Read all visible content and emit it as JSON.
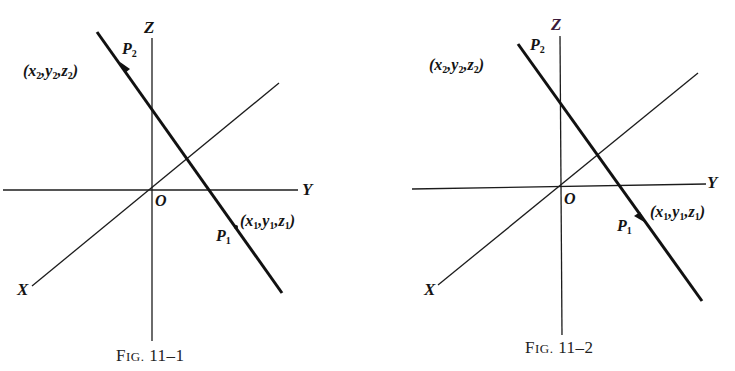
{
  "figures": [
    {
      "caption_prefix": "F",
      "caption_small": "ig.",
      "caption_number": "11–1",
      "caption": "Fig. 11–1",
      "axes": {
        "x": "X",
        "y": "Y",
        "z": "Z",
        "origin": "O"
      },
      "points": {
        "p1": {
          "name": "P",
          "sub": "1",
          "coords_text": "(x₁, y₁, z₁)",
          "x": "x",
          "y": "y",
          "z": "z"
        },
        "p2": {
          "name": "P",
          "sub": "2",
          "coords_text": "(x₂, y₂, z₂)",
          "x": "x",
          "y": "y",
          "z": "z"
        }
      },
      "arrow_direction": "toward P2 (upward-left)"
    },
    {
      "caption_prefix": "F",
      "caption_small": "ig.",
      "caption_number": "11–2",
      "caption": "Fig. 11–2",
      "axes": {
        "x": "X",
        "y": "Y",
        "z": "Z",
        "origin": "O"
      },
      "points": {
        "p1": {
          "name": "P",
          "sub": "1",
          "coords_text": "(x₁, y₁, z₁)",
          "x": "x",
          "y": "y",
          "z": "z"
        },
        "p2": {
          "name": "P",
          "sub": "2",
          "coords_text": "(x₂, y₂, z₂)",
          "x": "x",
          "y": "y",
          "z": "z"
        }
      },
      "arrow_direction": "toward P1 (downward-right)"
    }
  ],
  "subscripts": {
    "one": "1",
    "two": "2"
  },
  "punct": {
    "open": "(",
    "close": ")",
    "comma": ","
  },
  "colors": {
    "ink": "#111111",
    "background": "#ffffff"
  }
}
